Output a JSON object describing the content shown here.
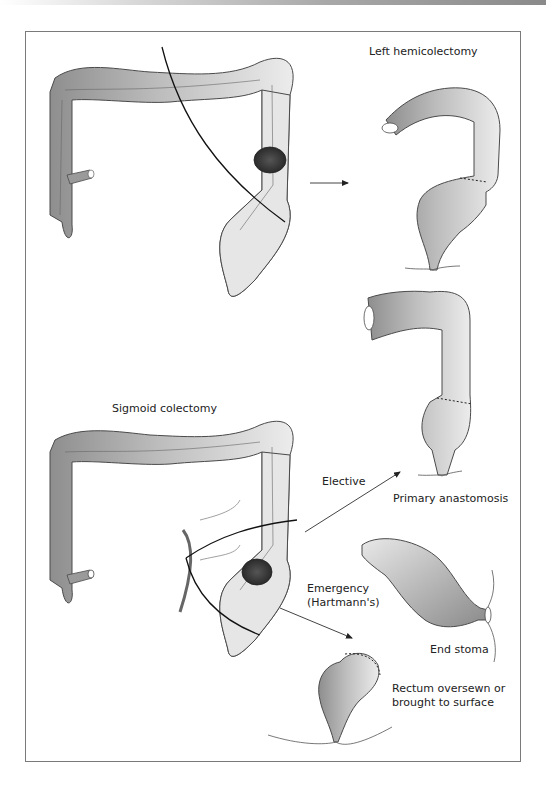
{
  "figure": {
    "panels": [
      {
        "id": "left-hemicolectomy",
        "title": "Left hemicolectomy"
      },
      {
        "id": "sigmoid-colectomy",
        "title": "Sigmoid colectomy",
        "options": [
          {
            "label": "Elective",
            "result": "Primary anastomosis"
          },
          {
            "label": "Emergency\n(Hartmann's)",
            "result": "End stoma",
            "secondary_result": "Rectum oversewn or brought to surface"
          }
        ]
      }
    ],
    "labels": {
      "left_hemicolectomy": "Left hemicolectomy",
      "sigmoid_colectomy": "Sigmoid colectomy",
      "elective": "Elective",
      "primary_anastomosis": "Primary anastomosis",
      "emergency_line1": "Emergency",
      "emergency_line2": "(Hartmann's)",
      "end_stoma": "End stoma",
      "rectum_line1": "Rectum oversewn or",
      "rectum_line2": "brought to surface"
    },
    "colors": {
      "outline": "#4a4a4a",
      "colon_dark": "#8e8e8e",
      "colon_light": "#e6e6e6",
      "tumour": "#3a3a3a",
      "frame": "#7a7a7a"
    },
    "icons": [
      "arrow-icon",
      "tumour-icon",
      "suture-line-icon",
      "resection-line-icon"
    ]
  }
}
